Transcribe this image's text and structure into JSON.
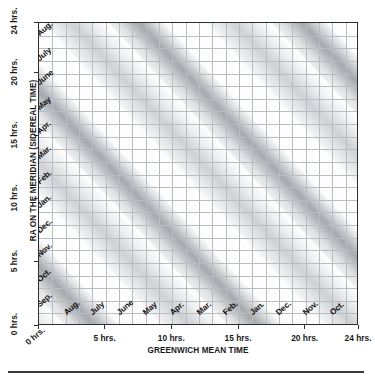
{
  "chart_data": {
    "type": "heatmap",
    "title": "",
    "xlabel": "GREENWICH MEAN TIME",
    "ylabel": "RA ON THE MERIDIAN (SIDEREAL TIME)",
    "xlim": [
      0,
      24
    ],
    "ylim": [
      0,
      24
    ],
    "grid": true,
    "legend": "none",
    "x_ticks": [
      {
        "value": 0,
        "label": "0 hrs."
      },
      {
        "value": 5,
        "label": "5 hrs."
      },
      {
        "value": 10,
        "label": "10 hrs."
      },
      {
        "value": 15,
        "label": "15 hrs."
      },
      {
        "value": 20,
        "label": "20 hrs."
      },
      {
        "value": 24,
        "label": "24 hrs."
      }
    ],
    "y_ticks": [
      {
        "value": 0,
        "label": "0 hrs."
      },
      {
        "value": 5,
        "label": "5 hrs."
      },
      {
        "value": 10,
        "label": "10 hrs."
      },
      {
        "value": 15,
        "label": "15 hrs."
      },
      {
        "value": 20,
        "label": "20 hrs."
      },
      {
        "value": 24,
        "label": "24 hrs."
      }
    ],
    "x_month_labels": [
      "Sep.",
      "Aug.",
      "July",
      "June",
      "May",
      "Apr.",
      "Mar.",
      "Feb.",
      "Jan.",
      "Dec.",
      "Nov.",
      "Oct."
    ],
    "y_month_labels": [
      "Sep.",
      "Oct.",
      "Nov.",
      "Dec.",
      "Jan.",
      "Feb.",
      "Mar.",
      "Apr.",
      "May",
      "June",
      "July",
      "Aug."
    ],
    "bands": [
      {
        "name": "band-1",
        "offset_hours": -13.0,
        "width_hours": 3.2,
        "shade": "dark"
      },
      {
        "name": "band-2",
        "offset_hours": 11.0,
        "width_hours": 3.2,
        "shade": "dark"
      },
      {
        "name": "band-3",
        "offset_hours": 35.0,
        "width_hours": 3.2,
        "shade": "dark"
      }
    ],
    "colors": {
      "band_dark": "#a8abaf",
      "band_mid": "#c9ccd0",
      "band_light": "#e6e8ea",
      "background": "#ffffff",
      "grid": "#b9bcc0",
      "frame": "#2e2e2e",
      "text": "#1a1a1a"
    }
  },
  "axes": {
    "y_title": "RA ON THE MERIDIAN (SIDEREAL TIME)",
    "x_title": "GREENWICH MEAN TIME"
  },
  "plot_labels": {
    "left_months_top_to_bottom": [
      "Aug.",
      "July",
      "June",
      "May",
      "Apr.",
      "Mar.",
      "Feb.",
      "Jan.",
      "Dec.",
      "Nov.",
      "Oct.",
      "Sep."
    ],
    "bottom_months_left_to_right": [
      "Sep.",
      "Aug.",
      "July",
      "June",
      "May",
      "Apr.",
      "Mar.",
      "Feb.",
      "Jan.",
      "Dec.",
      "Nov.",
      "Oct."
    ]
  }
}
